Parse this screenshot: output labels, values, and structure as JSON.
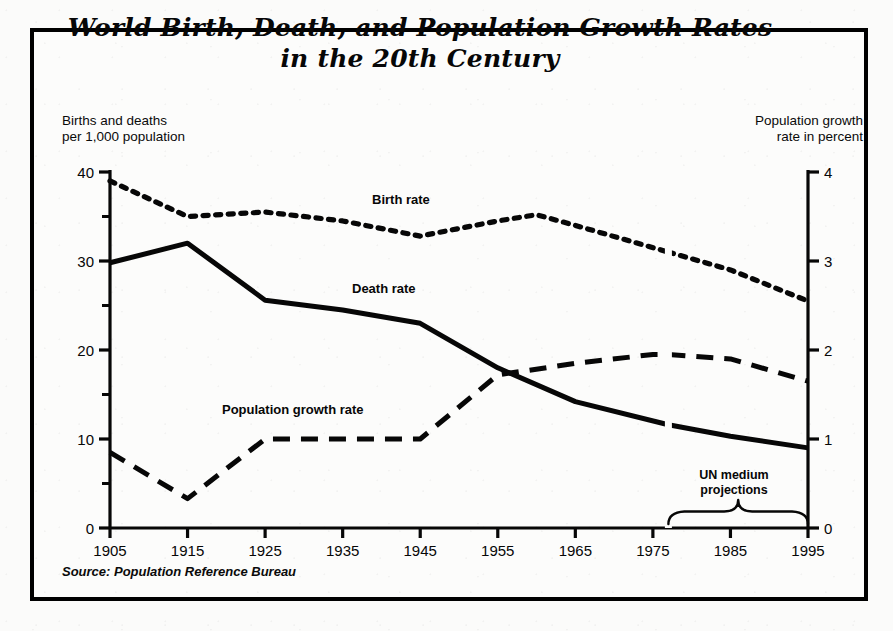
{
  "figure": {
    "title_line1": "World Birth, Death, and Population Growth Rates",
    "title_line2": "in the 20th Century",
    "left_axis_header_line1": "Births and deaths",
    "left_axis_header_line2": "per 1,000 population",
    "right_axis_header_line1": "Population growth",
    "right_axis_header_line2": "rate in percent",
    "source": "Source:  Population Reference Bureau",
    "projection_note_line1": "UN medium",
    "projection_note_line2": "projections",
    "ink_color": "#070707",
    "paper_color": "#fcfcfb"
  },
  "chart_data": {
    "type": "line",
    "title": "World Birth, Death, and Population Growth Rates in the 20th Century",
    "xlabel": "",
    "ylabel": "Births and deaths per 1,000 population",
    "y2label": "Population growth rate in percent",
    "xlim": [
      1905,
      1995
    ],
    "ylim": [
      0,
      40
    ],
    "y2lim": [
      0,
      4
    ],
    "grid": false,
    "legend": "inline-labels",
    "xticks": [
      1905,
      1915,
      1925,
      1935,
      1945,
      1955,
      1965,
      1975,
      1985,
      1995
    ],
    "yticks": [
      0,
      10,
      20,
      30,
      40
    ],
    "yticks_minor": [
      5,
      15,
      25,
      35
    ],
    "y2ticks": [
      0,
      1,
      2,
      3,
      4
    ],
    "projection_start_year": 1977,
    "series": [
      {
        "name": "Birth rate",
        "axis": "left",
        "style": "dotted",
        "x": [
          1905,
          1915,
          1925,
          1935,
          1945,
          1955,
          1960,
          1965,
          1977,
          1985,
          1995
        ],
        "values": [
          39.0,
          35.0,
          35.5,
          34.5,
          32.8,
          34.5,
          35.2,
          34.0,
          31.0,
          29.0,
          25.5
        ]
      },
      {
        "name": "Death rate",
        "axis": "left",
        "style": "solid",
        "x": [
          1905,
          1915,
          1925,
          1935,
          1945,
          1955,
          1965,
          1977,
          1985,
          1995
        ],
        "values": [
          29.8,
          32.0,
          25.6,
          24.5,
          23.0,
          18.0,
          14.2,
          11.6,
          10.3,
          9.0
        ]
      },
      {
        "name": "Population growth rate",
        "axis": "right",
        "style": "dashed",
        "x": [
          1905,
          1915,
          1925,
          1935,
          1945,
          1955,
          1965,
          1975,
          1977,
          1985,
          1995
        ],
        "values": [
          0.85,
          0.33,
          1.0,
          1.0,
          1.0,
          1.72,
          1.85,
          1.95,
          1.95,
          1.9,
          1.65
        ]
      }
    ]
  }
}
